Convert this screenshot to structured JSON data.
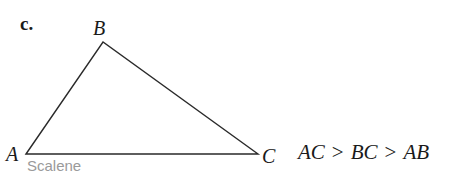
{
  "part_label": "c.",
  "triangle": {
    "vertices": {
      "A": {
        "label": "A",
        "x": 26,
        "y": 154
      },
      "B": {
        "label": "B",
        "x": 103,
        "y": 42
      },
      "C": {
        "label": "C",
        "x": 258,
        "y": 154
      }
    },
    "stroke_color": "#2a2a2a",
    "classification": "Scalene"
  },
  "relation": {
    "terms": [
      "AC",
      "BC",
      "AB"
    ],
    "operators": [
      ">",
      ">"
    ]
  }
}
